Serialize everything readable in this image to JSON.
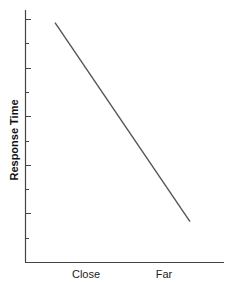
{
  "chart_data": {
    "type": "line",
    "title": "",
    "xlabel": "",
    "ylabel": "Response Time",
    "categories": [
      "Close",
      "Far"
    ],
    "series": [
      {
        "name": "Response Time",
        "values": [
          9.5,
          1.6
        ]
      }
    ],
    "ylim": [
      0,
      10
    ],
    "y_tick_count": 10,
    "y_tick_labels": [],
    "grid": false,
    "legend": "none",
    "line_color": "#555555",
    "axis_color": "#444444"
  }
}
